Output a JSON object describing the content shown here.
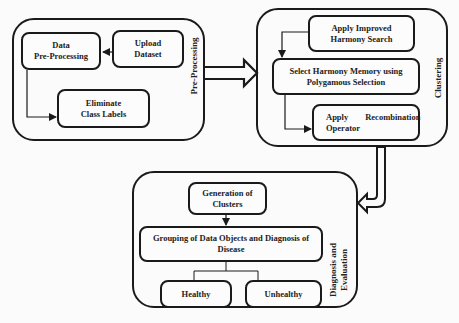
{
  "diagram": {
    "colors": {
      "stroke": "#1a1a1a",
      "background": "#fbfbfb",
      "text": "#222222"
    },
    "stages": [
      {
        "id": "preprocessing",
        "label": "Pre-Processing",
        "nodes": [
          {
            "id": "data-preprocessing",
            "text": "Data\nPre-Processing"
          },
          {
            "id": "upload-dataset",
            "text": "Upload\nDataset"
          },
          {
            "id": "eliminate-class-labels",
            "text": "Eliminate\nClass Labels"
          }
        ]
      },
      {
        "id": "clustering",
        "label": "Clustering",
        "nodes": [
          {
            "id": "apply-ihs",
            "text": "Apply Improved\nHarmony Search"
          },
          {
            "id": "select-hm",
            "text": "Select Harmony Memory using\nPolygamous Selection"
          },
          {
            "id": "apply-recombination",
            "text": "Apply        Recombination\nOperator"
          }
        ]
      },
      {
        "id": "diagnosis",
        "label": "Diagnosis and\nEvaluation",
        "nodes": [
          {
            "id": "generation-clusters",
            "text": "Generation of\nClusters"
          },
          {
            "id": "grouping",
            "text": "Grouping of Data Objects and Diagnosis of\nDisease"
          },
          {
            "id": "healthy",
            "text": "Healthy"
          },
          {
            "id": "unhealthy",
            "text": "Unhealthy"
          }
        ]
      }
    ],
    "edges": [
      {
        "from": "upload-dataset",
        "to": "data-preprocessing"
      },
      {
        "from": "data-preprocessing",
        "to": "eliminate-class-labels"
      },
      {
        "from": "preprocessing",
        "to": "clustering",
        "style": "hollow"
      },
      {
        "from": "apply-ihs",
        "to": "select-hm"
      },
      {
        "from": "select-hm",
        "to": "apply-recombination"
      },
      {
        "from": "clustering",
        "to": "diagnosis",
        "style": "hollow"
      },
      {
        "from": "generation-clusters",
        "to": "grouping"
      },
      {
        "from": "grouping",
        "to": "healthy"
      },
      {
        "from": "grouping",
        "to": "unhealthy"
      }
    ]
  }
}
